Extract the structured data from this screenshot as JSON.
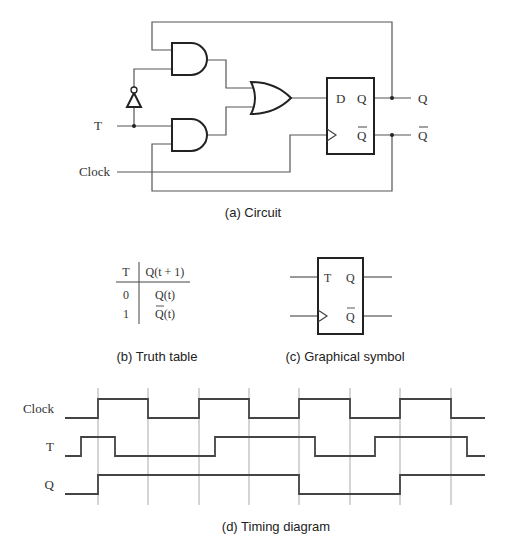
{
  "circuit": {
    "caption": "(a) Circuit",
    "labels": {
      "t_input": "T",
      "clock_input": "Clock",
      "d_pin": "D",
      "q_pin": "Q",
      "qbar_pin": "Q",
      "q_output": "Q",
      "qbar_output": "Q"
    }
  },
  "truth_table": {
    "caption": "(b) Truth table",
    "headers": [
      "T",
      "Q(t + 1)"
    ],
    "rows": [
      [
        "0",
        "Q(t)"
      ],
      [
        "1",
        "Q(t)"
      ]
    ],
    "overbar_rows": [
      1
    ]
  },
  "symbol": {
    "caption": "(c) Graphical symbol",
    "labels": {
      "t_pin": "T",
      "q_pin": "Q",
      "qbar_pin": "Q"
    }
  },
  "timing": {
    "caption": "(d) Timing diagram",
    "signals": [
      {
        "name": "Clock",
        "start_level": 0,
        "transitions_x": [
          98,
          148,
          199,
          249,
          299,
          350,
          400,
          451
        ]
      },
      {
        "name": "T",
        "start_level": 0,
        "transitions_x": [
          81,
          115,
          215,
          315,
          375,
          467
        ]
      },
      {
        "name": "Q",
        "start_level": 0,
        "transitions_x": [
          98,
          299,
          400
        ]
      }
    ],
    "x_start": 65,
    "x_end": 485,
    "gridlines_x": [
      98,
      148,
      199,
      249,
      299,
      350,
      400,
      451
    ]
  }
}
